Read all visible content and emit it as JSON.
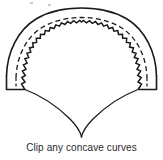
{
  "figure": {
    "caption": "Clip any concave curves",
    "ink_color": "#1a1a1a",
    "background_color": "#ffffff",
    "parts": {
      "outer_arc": "solid-outer-arc",
      "seam_line": "dashed-seam-line",
      "clipped_edge": "zigzag-clipped-edge",
      "left_tab": "left-corner-tab",
      "right_tab": "right-corner-tab",
      "lower_left_curve": "lower-left-concave-curve",
      "lower_right_curve": "lower-right-concave-curve",
      "bottom_point": "bottom-v-point"
    },
    "geometry": {
      "width": 163,
      "height": 160,
      "arc_top_y": 11,
      "arc_left_x": 5,
      "arc_right_x": 156,
      "tab_baseline_y": 89,
      "v_point_x": 82,
      "v_point_y": 137
    }
  }
}
